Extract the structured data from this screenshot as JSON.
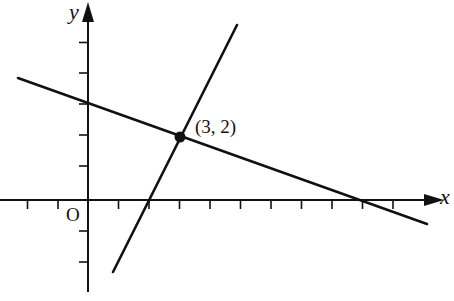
{
  "diagram": {
    "type": "coordinate-plane",
    "axes": {
      "x_label": "x",
      "y_label": "y",
      "origin_label": "O",
      "unit_px": 30.5,
      "x_tick_range": [
        -2,
        10
      ],
      "y_tick_range": [
        -2,
        5
      ]
    },
    "lines": [
      {
        "name": "steep-line",
        "equation": "y = 2x - 4",
        "slope": 2,
        "y_intercept": -4,
        "x_intercept": 2
      },
      {
        "name": "shallow-line",
        "equation": "y = -x/3 + 3",
        "slope": -0.3333,
        "y_intercept": 3,
        "x_intercept": 9
      }
    ],
    "intersection": {
      "x": 3,
      "y": 2,
      "label": "(3, 2)"
    },
    "colors": {
      "stroke": "#111111",
      "background": "#ffffff"
    }
  }
}
